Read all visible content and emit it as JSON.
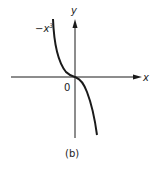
{
  "figure": {
    "caption": "(b)",
    "function_label": "−x",
    "function_exponent": "3",
    "x_axis_label": "x",
    "y_axis_label": "y",
    "origin_label": "0"
  },
  "colors": {
    "ink": "#1a1a1a",
    "background": "#ffffff"
  }
}
